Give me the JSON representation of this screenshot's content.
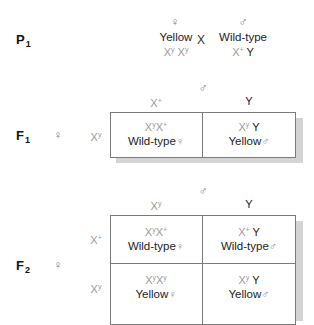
{
  "p1": {
    "label": "P",
    "label_sub": "1",
    "female": {
      "symbol": "♀",
      "phenotype": "Yellow",
      "genotype_parts": [
        "X",
        "y",
        " X",
        "y"
      ]
    },
    "cross_symbol": "X",
    "male": {
      "symbol": "♂",
      "phenotype": "Wild-type",
      "genotype_x": "X",
      "genotype_x_sup": "+",
      "genotype_y": " Y"
    }
  },
  "f1": {
    "label": "F",
    "label_sub": "1",
    "female_symbol": "♀",
    "male_symbol": "♂",
    "col_headers": [
      {
        "base": "X",
        "sup": "+"
      },
      {
        "base": "Y",
        "sup": ""
      }
    ],
    "row_headers": [
      {
        "base": "X",
        "sup": "y"
      }
    ],
    "cells": [
      {
        "geno_a": "X",
        "geno_a_sup": "y",
        "geno_b": "X",
        "geno_b_sup": "+",
        "geno_y": "",
        "phenotype": "Wild-type",
        "sex": "♀"
      },
      {
        "geno_a": "X",
        "geno_a_sup": "y",
        "geno_b": "",
        "geno_b_sup": "",
        "geno_y": " Y",
        "phenotype": "Yellow",
        "sex": "♂"
      }
    ]
  },
  "f2": {
    "label": "F",
    "label_sub": "2",
    "female_symbol": "♀",
    "male_symbol": "♂",
    "col_headers": [
      {
        "base": "X",
        "sup": "y"
      },
      {
        "base": "Y",
        "sup": ""
      }
    ],
    "row_headers": [
      {
        "base": "X",
        "sup": "+"
      },
      {
        "base": "X",
        "sup": "y"
      }
    ],
    "cells": [
      {
        "geno_a": "X",
        "geno_a_sup": "y",
        "geno_b": "X",
        "geno_b_sup": "+",
        "geno_y": "",
        "phenotype": "Wild-type",
        "sex": "♀"
      },
      {
        "geno_a": "X",
        "geno_a_sup": "+",
        "geno_b": "",
        "geno_b_sup": "",
        "geno_y": " Y",
        "phenotype": "Wild-type",
        "sex": "♂"
      },
      {
        "geno_a": "X",
        "geno_a_sup": "y",
        "geno_b": "X",
        "geno_b_sup": "y",
        "geno_y": "",
        "phenotype": "Yellow",
        "sex": "♀"
      },
      {
        "geno_a": "X",
        "geno_a_sup": "y",
        "geno_b": "",
        "geno_b_sup": "",
        "geno_y": " Y",
        "phenotype": "Yellow",
        "sex": "♂"
      }
    ]
  },
  "colors": {
    "chromosome_x": "#9a9a9a",
    "chromosome_y": "#222222",
    "border": "#7a7a7a",
    "shadow": "#d4d4d4"
  }
}
